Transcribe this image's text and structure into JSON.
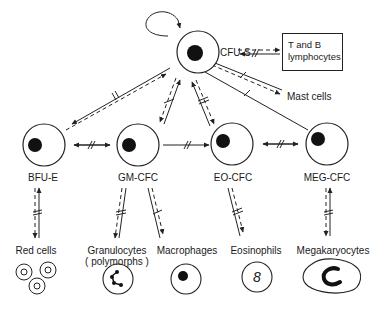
{
  "diagram": {
    "type": "hematopoietic cell lineage diagram",
    "stem_cell": {
      "label": "CFU-S",
      "self_renewal": true
    },
    "side_outputs": [
      {
        "label": "T and B lymphocytes",
        "boxed": true
      },
      {
        "label": "Mast cells",
        "boxed": false
      }
    ],
    "progenitors": [
      {
        "id": "bfu-e",
        "label": "BFU-E",
        "product": "Red cells"
      },
      {
        "id": "gm-cfc",
        "label": "GM-CFC",
        "product": "Granulocytes",
        "product_note": "( polymorphs )",
        "product2": "Macrophages"
      },
      {
        "id": "eo-cfc",
        "label": "EO-CFC",
        "product": "Eosinophils"
      },
      {
        "id": "meg-cfc",
        "label": "MEG-CFC",
        "product": "Megakaryocytes"
      }
    ],
    "products": [
      "Red cells",
      "Granulocytes",
      "( polymorphs )",
      "Macrophages",
      "Eosinophils",
      "Megakaryocytes"
    ]
  }
}
